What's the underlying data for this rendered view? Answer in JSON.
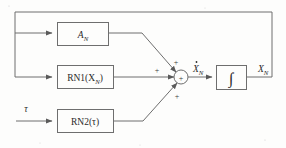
{
  "diagram": {
    "background_color": "#fdfdfc",
    "line_color": "#6e6e6e",
    "text_color": "#2a2a2a",
    "blocks": [
      {
        "id": "a_n",
        "label_main": "A",
        "label_sub": "N",
        "x": 57,
        "y": 22,
        "w": 51,
        "h": 23
      },
      {
        "id": "rn1",
        "label_main": "RN1(X",
        "label_sub": "N",
        "label_tail": ")",
        "x": 57,
        "y": 65,
        "w": 56,
        "h": 23
      },
      {
        "id": "rn2",
        "label_main": "RN2(τ)",
        "x": 57,
        "y": 109,
        "w": 56,
        "h": 23
      },
      {
        "id": "integrator",
        "label_main": "∫",
        "x": 216,
        "y": 65,
        "w": 30,
        "h": 24
      }
    ],
    "summing_junction": {
      "id": "sum",
      "cx": 181,
      "cy": 77,
      "r": 7,
      "inner_symbol": "+",
      "signs": [
        {
          "name": "plus-top",
          "symbol": "+",
          "x": 176,
          "y": 62
        },
        {
          "name": "plus-left",
          "symbol": "+",
          "x": 155,
          "y": 73
        },
        {
          "name": "plus-bottom",
          "symbol": "+",
          "x": 176,
          "y": 97
        }
      ]
    },
    "signals": [
      {
        "name": "tau-input",
        "text": "τ",
        "x": 26,
        "y": 109
      },
      {
        "name": "xdot-n",
        "text": "X",
        "sub": "N",
        "dot": true,
        "x": 192,
        "y": 72
      },
      {
        "name": "x-n-output",
        "text": "X",
        "sub": "N",
        "dot": false,
        "x": 258,
        "y": 72
      }
    ],
    "feedback": {
      "name": "feedback-path",
      "description": "integrator output returns along right edge, across top, down left bus into A_N and RN1 blocks"
    }
  }
}
